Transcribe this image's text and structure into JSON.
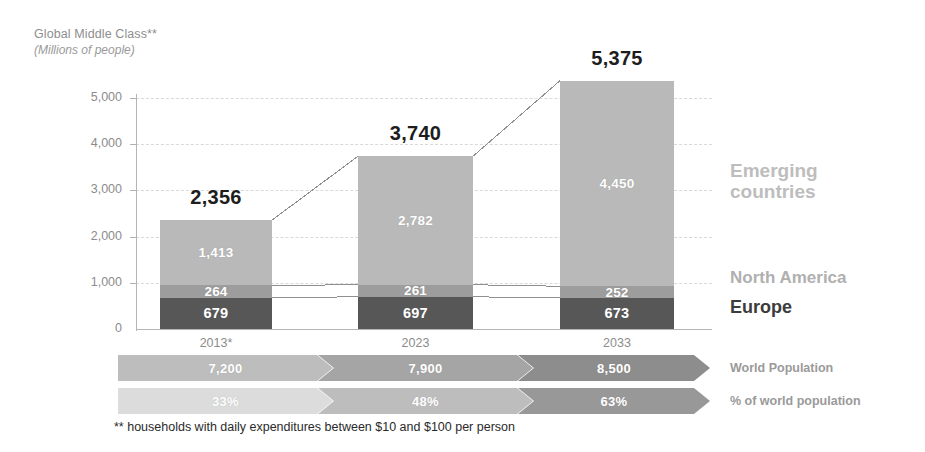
{
  "header": {
    "title": "Global Middle Class**",
    "subtitle": "(Millions of people)"
  },
  "legend": {
    "emerging_line1": "Emerging",
    "emerging_line2": "countries",
    "north_america": "North America",
    "europe": "Europe"
  },
  "ribbons": {
    "world_population_label": "World Population",
    "percent_label": "% of world population"
  },
  "footnote": "** households with daily expenditures between $10 and $100 per person",
  "colors": {
    "emerging": "#b9b9b9",
    "north_america": "#9d9d9d",
    "europe": "#575757",
    "ribbon_pop_1": "#bdbdbd",
    "ribbon_pop_2": "#a5a5a5",
    "ribbon_pop_3": "#8d8d8d",
    "ribbon_pct_1": "#dcdcdc",
    "ribbon_pct_2": "#bdbdbd",
    "ribbon_pct_3": "#989898",
    "total_label": "#1d1d1d",
    "axis": "#b5b5b5",
    "grid": "#d9d9d9"
  },
  "chart_data": {
    "type": "bar",
    "title": "Global Middle Class**",
    "subtitle": "(Millions of people)",
    "xlabel": "",
    "ylabel": "Millions of people",
    "ylim": [
      0,
      5600
    ],
    "yticks": [
      0,
      1000,
      2000,
      3000,
      4000,
      5000
    ],
    "ytick_labels": [
      "0",
      "1,000",
      "2,000",
      "3,000",
      "4,000",
      "5,000"
    ],
    "grid": true,
    "legend_position": "right",
    "stacked": true,
    "categories": [
      "2013*",
      "2023",
      "2033"
    ],
    "series": [
      {
        "name": "Europe",
        "values": [
          679,
          697,
          673
        ],
        "labels": [
          "679",
          "697",
          "673"
        ],
        "color": "#575757"
      },
      {
        "name": "North America",
        "values": [
          264,
          261,
          252
        ],
        "labels": [
          "264",
          "261",
          "252"
        ],
        "color": "#9d9d9d"
      },
      {
        "name": "Emerging countries",
        "values": [
          1413,
          2782,
          4450
        ],
        "labels": [
          "1,413",
          "2,782",
          "4,450"
        ],
        "color": "#b9b9b9"
      }
    ],
    "totals": [
      2356,
      3740,
      5375
    ],
    "total_labels": [
      "2,356",
      "3,740",
      "5,375"
    ],
    "annotations": {
      "world_population": {
        "label": "World Population",
        "values": [
          7200,
          7900,
          8500
        ],
        "value_labels": [
          "7,200",
          "7,900",
          "8,500"
        ]
      },
      "percent_of_world_population": {
        "label": "% of world population",
        "values": [
          33,
          48,
          63
        ],
        "value_labels": [
          "33%",
          "48%",
          "63%"
        ]
      }
    },
    "footnote": "** households with daily expenditures between $10 and $100 per person"
  }
}
